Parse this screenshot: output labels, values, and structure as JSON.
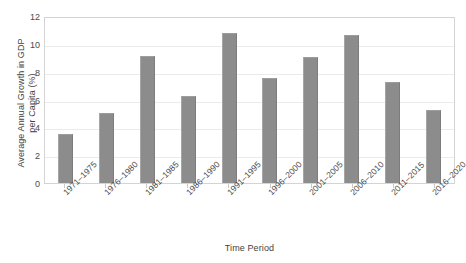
{
  "chart_data": {
    "type": "bar",
    "title": "",
    "xlabel": "Time Period",
    "ylabel": "Average Annual Growth in GDP per Capita (%)",
    "ylabel_line1": "Average Annual Growth in GDP",
    "ylabel_line2": "per Capita (%)",
    "categories": [
      "1971–1975",
      "1976–1980",
      "1981–1985",
      "1986–1990",
      "1991–1995",
      "1996–2000",
      "2001–2005",
      "2006–2010",
      "2011–2015",
      "2016–2020"
    ],
    "values": [
      3.5,
      5.0,
      9.1,
      6.25,
      10.8,
      7.55,
      9.05,
      10.65,
      7.25,
      5.25
    ],
    "ylim": [
      0,
      12
    ],
    "yticks": [
      0,
      2,
      4,
      6,
      8,
      10,
      12
    ],
    "ytick_labels": [
      "0",
      "2",
      "4",
      "6",
      "8",
      "10",
      "12"
    ],
    "grid": true,
    "legend": false,
    "bar_color": "#8c8c8c",
    "plot_border_color": "#d4d4d4",
    "gridline_color": "#ebebeb",
    "background_color": "#ffffff"
  }
}
